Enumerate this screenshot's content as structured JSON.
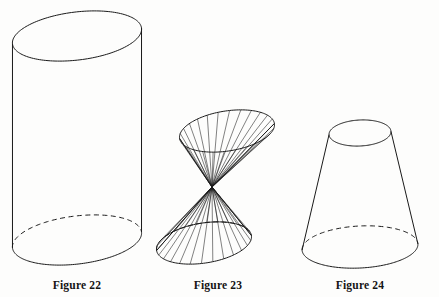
{
  "plate": {
    "background_color": "#fdfdfc",
    "ink_color": "#1a1a1a",
    "width": 439,
    "height": 297
  },
  "figures": [
    {
      "id": "figure-22",
      "caption": "Figure 22",
      "shape_name": "cylinder",
      "caption_center_x": 77,
      "caption_y": 279,
      "geometry": {
        "top_ellipse": {
          "cx": 77,
          "cy": 36,
          "rx": 65,
          "ry": 24,
          "rotate": -7
        },
        "bottom_ellipse": {
          "cx": 77,
          "cy": 240,
          "rx": 65,
          "ry": 24,
          "rotate": -7
        },
        "left_side_x": 12,
        "right_side_x": 142,
        "hidden_arc_style": "dashed"
      }
    },
    {
      "id": "figure-23",
      "caption": "Figure 23",
      "shape_name": "double-cone",
      "caption_center_x": 218,
      "caption_y": 279,
      "geometry": {
        "apex": {
          "x": 212,
          "y": 187
        },
        "top_ellipse": {
          "cx": 227,
          "cy": 131,
          "rx": 48,
          "ry": 20,
          "rotate": -9
        },
        "bottom_ellipse": {
          "cx": 204,
          "cy": 243,
          "rx": 48,
          "ry": 20,
          "rotate": -9
        },
        "ruling_count": 26,
        "hidden_arc_style": "dashed"
      }
    },
    {
      "id": "figure-24",
      "caption": "Figure 24",
      "shape_name": "frustum",
      "caption_center_x": 360,
      "caption_y": 279,
      "geometry": {
        "top_ellipse": {
          "cx": 360,
          "cy": 133,
          "rx": 31,
          "ry": 13,
          "rotate": -3
        },
        "bottom_ellipse": {
          "cx": 360,
          "cy": 247,
          "rx": 58,
          "ry": 21,
          "rotate": -3
        },
        "hidden_arc_style": "dashed"
      }
    }
  ],
  "stroke": {
    "outline_width": 1.0,
    "ruling_width": 0.55,
    "dash_pattern": "5 3.5"
  }
}
